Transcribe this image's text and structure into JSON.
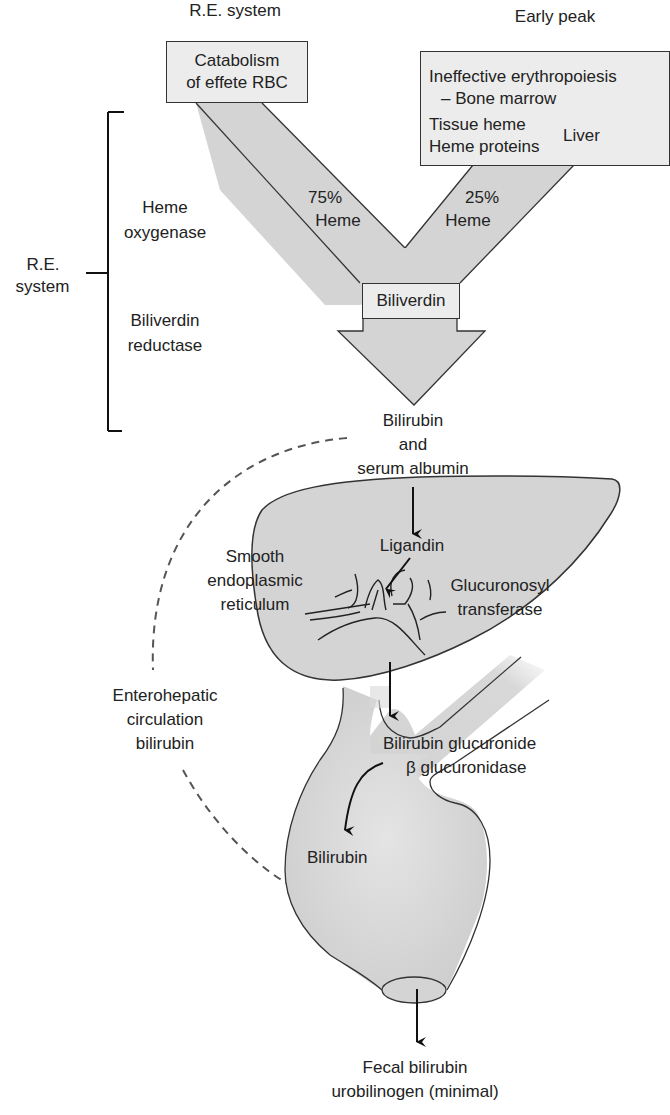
{
  "header": {
    "left_title": "R.E. system",
    "right_title": "Early peak"
  },
  "sources": {
    "rbc_box": {
      "line1": "Catabolism",
      "line2": "of effete RBC"
    },
    "early_box": {
      "line1": "Ineffective erythropoiesis",
      "line2": "– Bone marrow",
      "line3": "Tissue heme",
      "line4": "Heme proteins",
      "bracket_label": "Liver"
    }
  },
  "flows": {
    "left_pct": "75%",
    "left_label": "Heme",
    "right_pct": "25%",
    "right_label": "Heme",
    "junction_box": "Biliverdin"
  },
  "re_system": {
    "label_line1": "R.E.",
    "label_line2": "system",
    "enzyme1_line1": "Heme",
    "enzyme1_line2": "oxygenase",
    "enzyme2_line1": "Biliverdin",
    "enzyme2_line2": "reductase"
  },
  "transport": {
    "line1": "Bilirubin",
    "line2": "and",
    "line3": "serum albumin"
  },
  "liver": {
    "ligandin": "Ligandin",
    "ser_line1": "Smooth",
    "ser_line2": "endoplasmic",
    "ser_line3": "reticulum",
    "enzyme_line1": "Glucuronosyl",
    "enzyme_line2": "transferase"
  },
  "enterohepatic": {
    "line1": "Enterohepatic",
    "line2": "circulation",
    "line3": "bilirubin"
  },
  "intestine": {
    "conjugate": "Bilirubin glucuronide",
    "enzyme": "β glucuronidase",
    "product": "Bilirubin"
  },
  "output": {
    "line1": "Fecal bilirubin",
    "line2": "urobilinogen (minimal)"
  },
  "colors": {
    "fill": "#d4d4d4",
    "box_fill": "#ececec",
    "stroke": "#333333",
    "dashed": "#555555"
  }
}
